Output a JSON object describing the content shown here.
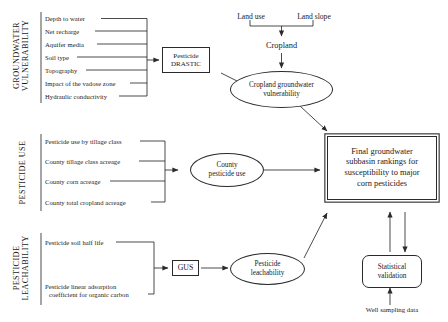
{
  "figure": {
    "type": "flowchart"
  },
  "groups": {
    "vulnerability": {
      "caption_line1": "GROUNDWATER",
      "caption_line2": "VULNERABILITY",
      "items": [
        "Depth to water",
        "Net recharge",
        "Aquifer media",
        "Soil type",
        "Topography",
        "Impact of the vadose zone",
        "Hydraulic conductivity"
      ]
    },
    "pesticide_use": {
      "caption_line1": "PESTICIDE USE",
      "items": [
        "Pesticide use by tillage class",
        "County tillage class acreage",
        "County corn acreage",
        "County total cropland acreage"
      ]
    },
    "leachability": {
      "caption_line1": "PESTICIDE",
      "caption_line2": "LEACHABILITY",
      "items": [
        "Pesticide soil half life",
        "Pesticide linear adsorption",
        "coefficient for organic carbon"
      ]
    }
  },
  "nodes": {
    "pesticide_drastic": {
      "line1": "Pesticide",
      "line2": "DRASTIC"
    },
    "land_use": "Land use",
    "land_slope": "Land slope",
    "cropland": "Cropland",
    "cropland_gw_vulnerability": {
      "line1": "Cropland groundwater",
      "line2": "vulnerability"
    },
    "county_pesticide_use": {
      "line1": "County",
      "line2": "pesticide use"
    },
    "gus": "GUS",
    "pesticide_leachability": {
      "line1": "Pesticide",
      "line2": "leachability"
    },
    "final_rankings": {
      "line1": "Final groundwater",
      "line2": "subbasin rankings for",
      "line3": "susceptibility to major",
      "line4": "corn pesticides"
    },
    "statistical_validation": {
      "line1": "Statistical",
      "line2": "validation"
    },
    "well_sampling_data": "Well sampling data"
  },
  "colors": {
    "ink": "#1a1a1a",
    "line": "#2a2a2a",
    "background": "#ffffff"
  }
}
